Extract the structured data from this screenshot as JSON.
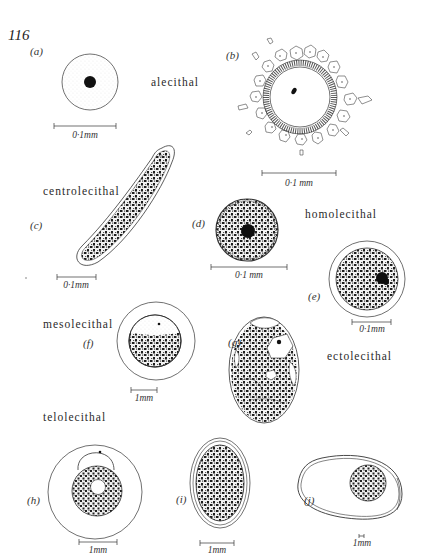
{
  "page_number": "116",
  "panels": [
    {
      "id": "a",
      "label": "(a)",
      "term": "alecithal",
      "scale": "0·1mm"
    },
    {
      "id": "b",
      "label": "(b)",
      "term": "",
      "scale": "0·1 mm"
    },
    {
      "id": "c",
      "label": "(c)",
      "term": "centrolecithal",
      "scale": "0·1mm"
    },
    {
      "id": "d",
      "label": "(d)",
      "term": "homolecithal",
      "scale": "0·1 mm"
    },
    {
      "id": "e",
      "label": "(e)",
      "term": "",
      "scale": "0·1mm"
    },
    {
      "id": "f",
      "label": "(f)",
      "term": "mesolecithal",
      "scale": "1mm"
    },
    {
      "id": "g",
      "label": "(g)",
      "term": "ectolecithal",
      "scale": ""
    },
    {
      "id": "h",
      "label": "(h)",
      "term": "telolecithal",
      "scale": "1mm"
    },
    {
      "id": "i",
      "label": "(i)",
      "term": "",
      "scale": "1mm"
    },
    {
      "id": "j",
      "label": "(j)",
      "term": "",
      "scale": "1mm"
    }
  ],
  "colors": {
    "ink": "#1a1a1a",
    "yolk": "#2b2b2b",
    "paper": "#ffffff"
  }
}
